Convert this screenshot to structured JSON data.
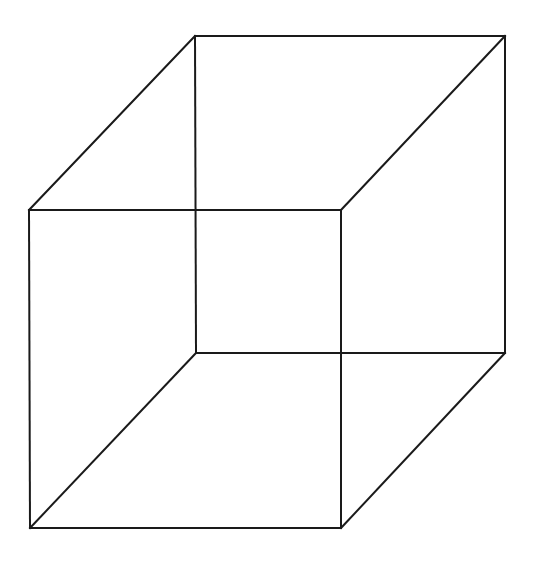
{
  "figure": {
    "name": "necker-cube",
    "type": "line-drawing",
    "background_color": "#ffffff",
    "stroke_color": "#1a1a1a",
    "stroke_width": 2,
    "canvas": {
      "width": 538,
      "height": 565
    },
    "vertices": {
      "square_a_top_left": {
        "x": 29,
        "y": 210
      },
      "square_a_top_right": {
        "x": 341,
        "y": 210
      },
      "square_a_bottom_right": {
        "x": 341,
        "y": 528
      },
      "square_a_bottom_left": {
        "x": 30,
        "y": 528
      },
      "square_b_top_left": {
        "x": 195,
        "y": 36
      },
      "square_b_top_right": {
        "x": 505,
        "y": 36
      },
      "square_b_bottom_right": {
        "x": 505,
        "y": 353
      },
      "square_b_bottom_left": {
        "x": 196,
        "y": 353
      }
    },
    "edges": [
      {
        "id": "front-top",
        "name": "front-face-top-edge",
        "points": "29,210 341,210"
      },
      {
        "id": "front-right",
        "name": "front-face-right-edge",
        "points": "341,210 341,528"
      },
      {
        "id": "front-bottom",
        "name": "front-face-bottom-edge",
        "points": "341,528 30,528"
      },
      {
        "id": "front-left",
        "name": "front-face-left-edge",
        "points": "30,528 29,210"
      },
      {
        "id": "back-top",
        "name": "back-face-top-edge",
        "points": "195,36 505,36"
      },
      {
        "id": "back-right",
        "name": "back-face-right-edge",
        "points": "505,36 505,353"
      },
      {
        "id": "back-bottom",
        "name": "back-face-bottom-edge",
        "points": "505,353 196,353"
      },
      {
        "id": "back-left",
        "name": "back-face-left-edge",
        "points": "196,353 195,36"
      },
      {
        "id": "connector-top-left",
        "name": "connecting-edge-top-left",
        "points": "29,210 195,36"
      },
      {
        "id": "connector-top-right",
        "name": "connecting-edge-top-right",
        "points": "341,210 505,36"
      },
      {
        "id": "connector-bottom-right",
        "name": "connecting-edge-bottom-right",
        "points": "341,528 505,353"
      },
      {
        "id": "connector-bottom-left",
        "name": "connecting-edge-bottom-left",
        "points": "30,528 196,353"
      }
    ]
  }
}
